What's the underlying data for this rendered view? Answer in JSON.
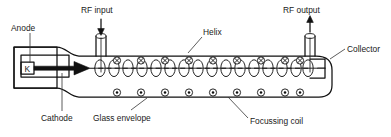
{
  "diagram": {
    "labels": {
      "anode": "Anode",
      "rf_input": "RF input",
      "helix": "Helix",
      "rf_output": "RF output",
      "collector": "Collector",
      "cathode": "Cathode",
      "glass_envelope": "Glass envelope",
      "focussing_coil": "Focussing coil",
      "cathode_symbol": "K"
    },
    "colors": {
      "ink": "#111111",
      "background": "#ffffff",
      "label_text": "#1a1a1a"
    },
    "counts": {
      "top_coil_symbols": 9,
      "bottom_coil_symbols": 9,
      "helix_turns": 16
    },
    "symbols": {
      "top_row_glyph": "circle-cross",
      "bottom_row_glyph": "circle-dot"
    }
  }
}
